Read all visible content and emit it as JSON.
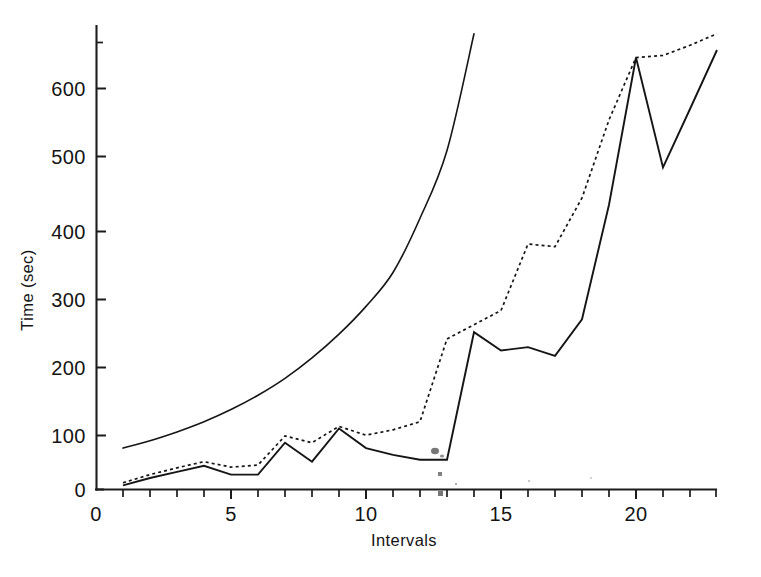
{
  "chart_data": {
    "type": "line",
    "title": "",
    "xlabel": "Intervals",
    "ylabel": "Time (sec)",
    "xlim": [
      0,
      23.4
    ],
    "ylim": [
      0,
      690
    ],
    "grid": false,
    "legend": "none",
    "x_ticks_major": [
      0,
      5,
      10,
      15,
      20
    ],
    "x_tick_labels": [
      "0",
      "5",
      "10",
      "15",
      "20"
    ],
    "x_ticks_minor": [
      1,
      2,
      3,
      4,
      6,
      7,
      8,
      9,
      11,
      12,
      13,
      14,
      16,
      17,
      18,
      19,
      21,
      22,
      23
    ],
    "y_ticks": [
      0,
      100,
      200,
      300,
      400,
      500,
      600
    ],
    "y_tick_labels": [
      "0",
      "100",
      "200",
      "300",
      "400",
      "500",
      "600"
    ],
    "series": [
      {
        "name": "upper-smooth-curve",
        "style": "solid-smooth",
        "x": [
          1,
          2,
          3,
          4,
          5,
          6,
          7,
          8,
          9,
          10,
          11,
          12,
          13,
          14
        ],
        "values": [
          61,
          72,
          85,
          100,
          118,
          139,
          164,
          194,
          229,
          270,
          320,
          400,
          500,
          672
        ]
      },
      {
        "name": "middle-dotted-curve",
        "style": "dotted",
        "x": [
          1,
          2,
          3,
          4,
          5,
          6,
          7,
          8,
          9,
          10,
          11,
          12,
          13,
          14,
          15,
          16,
          17,
          18,
          19,
          20,
          21,
          22,
          23
        ],
        "values": [
          10,
          22,
          32,
          41,
          33,
          36,
          79,
          69,
          93,
          80,
          88,
          100,
          222,
          243,
          264,
          362,
          358,
          430,
          545,
          637,
          640,
          655,
          672
        ]
      },
      {
        "name": "lower-solid-curve",
        "style": "solid",
        "x": [
          1,
          2,
          3,
          4,
          5,
          6,
          7,
          8,
          9,
          10,
          11,
          12,
          13,
          14,
          15,
          16,
          17,
          18,
          19,
          20,
          21,
          22,
          23
        ],
        "values": [
          6,
          17,
          26,
          35,
          22,
          22,
          69,
          41,
          90,
          61,
          51,
          44,
          44,
          232,
          205,
          210,
          197,
          251,
          420,
          637,
          475,
          561,
          648
        ]
      }
    ]
  },
  "axes": {
    "y_title": "Time (sec)",
    "x_title": "Intervals"
  },
  "artifacts": {
    "note": "scan specks"
  }
}
